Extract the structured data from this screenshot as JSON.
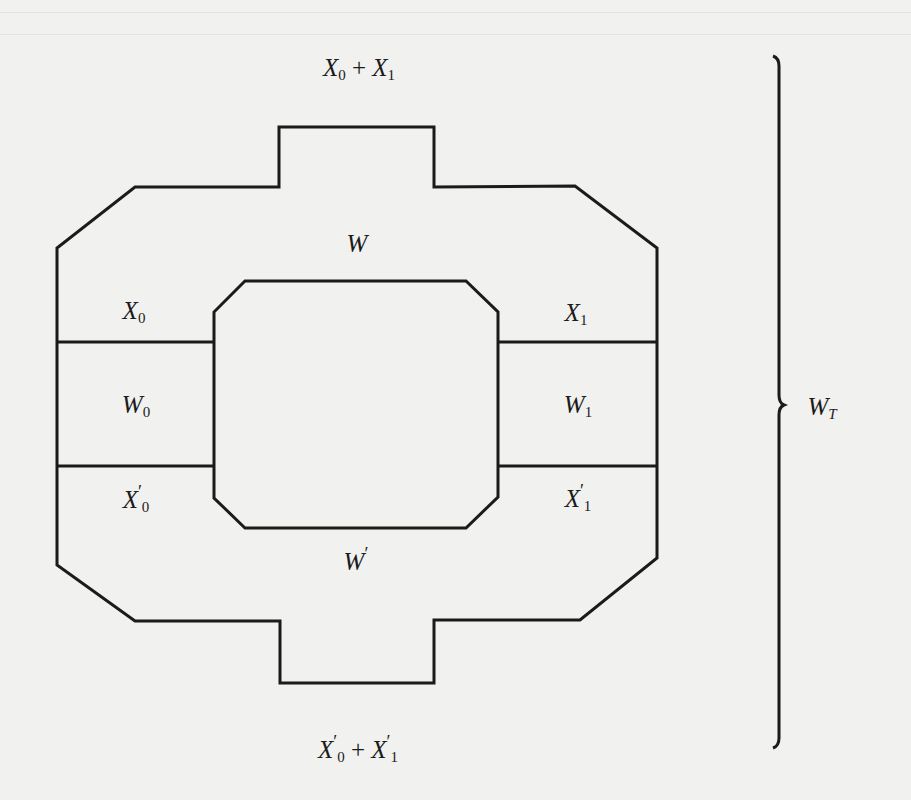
{
  "diagram": {
    "type": "region-decomposition",
    "labels": {
      "top": {
        "base": "X",
        "sub": "0",
        "op": " + ",
        "base2": "X",
        "sub2": "1"
      },
      "W": {
        "base": "W"
      },
      "X0": {
        "base": "X",
        "sub": "0"
      },
      "X1": {
        "base": "X",
        "sub": "1"
      },
      "W0": {
        "base": "W",
        "sub": "0"
      },
      "W1": {
        "base": "W",
        "sub": "1"
      },
      "X0p": {
        "base": "X",
        "prime": "′",
        "sub": "0"
      },
      "X1p": {
        "base": "X",
        "prime": "′",
        "sub": "1"
      },
      "Wp": {
        "base": "W",
        "prime": "′"
      },
      "bottom": {
        "base": "X",
        "prime": "′",
        "sub": "0",
        "op": " + ",
        "base2": "X",
        "prime2": "′",
        "sub2": "1"
      },
      "WT": {
        "base": "W",
        "sub": "T"
      }
    },
    "colors": {
      "ink": "#1b1b1b",
      "paper": "#f1f1ef"
    },
    "brace": {
      "side": "right",
      "label": "W_T"
    }
  }
}
